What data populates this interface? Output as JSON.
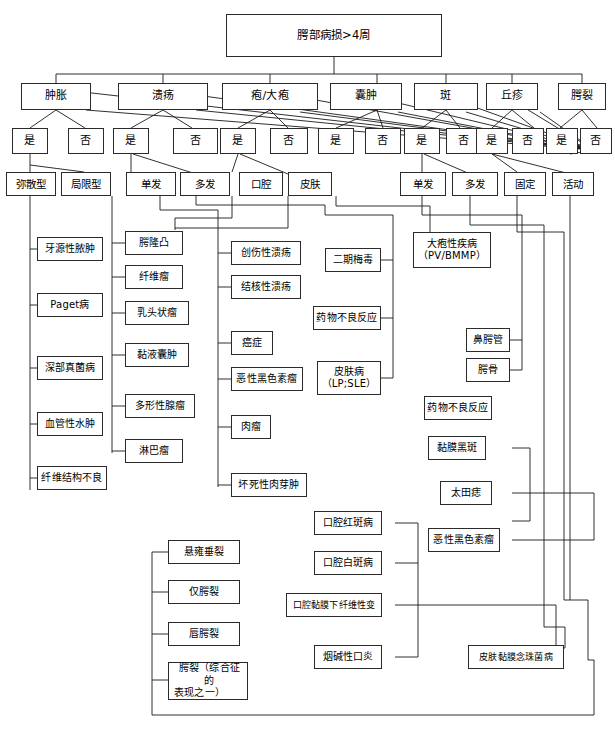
{
  "title": "腭部病损>4周",
  "root": {
    "label": "腭部病损>4周"
  },
  "categories": [
    {
      "id": "swelling",
      "label": "肿胀"
    },
    {
      "id": "ulcer",
      "label": "溃疡"
    },
    {
      "id": "vesicle",
      "label": "疱/大疱"
    },
    {
      "id": "cyst",
      "label": "囊肿"
    },
    {
      "id": "macule",
      "label": "斑"
    },
    {
      "id": "papule",
      "label": "丘疹"
    },
    {
      "id": "cleft",
      "label": "腭裂"
    }
  ],
  "decisions": [
    {
      "id": "swelling-yes",
      "label": "是"
    },
    {
      "id": "swelling-no",
      "label": "否"
    },
    {
      "id": "ulcer-yes",
      "label": "是"
    },
    {
      "id": "ulcer-no",
      "label": "否"
    },
    {
      "id": "vesicle-yes",
      "label": "是"
    },
    {
      "id": "vesicle-no",
      "label": "否"
    },
    {
      "id": "cyst-yes",
      "label": "是"
    },
    {
      "id": "cyst-no",
      "label": "否"
    },
    {
      "id": "macule-yes",
      "label": "是"
    },
    {
      "id": "macule-no",
      "label": "否"
    },
    {
      "id": "papule-yes",
      "label": "是"
    },
    {
      "id": "papule-no",
      "label": "否"
    },
    {
      "id": "cleft-yes",
      "label": "是"
    },
    {
      "id": "cleft-no",
      "label": "否"
    }
  ],
  "subtypes": [
    {
      "id": "diffuse",
      "label": "弥散型"
    },
    {
      "id": "localized",
      "label": "局限型"
    },
    {
      "id": "ulcer-single",
      "label": "单发"
    },
    {
      "id": "ulcer-multiple",
      "label": "多发"
    },
    {
      "id": "oral",
      "label": "口腔"
    },
    {
      "id": "skin",
      "label": "皮肤"
    },
    {
      "id": "cyst-single",
      "label": "单发"
    },
    {
      "id": "cyst-multiple",
      "label": "多发"
    },
    {
      "id": "fixed",
      "label": "固定"
    },
    {
      "id": "mobile",
      "label": "活动"
    }
  ],
  "diagnoses": {
    "diffuse_swelling": [
      {
        "id": "odontogenic-abscess",
        "label": "牙源性脓肿"
      },
      {
        "id": "paget-disease",
        "label": "Paget病"
      },
      {
        "id": "deep-fungal",
        "label": "深部真菌病"
      },
      {
        "id": "angioedema",
        "label": "血管性水肿"
      },
      {
        "id": "fibrous-dysplasia",
        "label": "纤维结构不良"
      }
    ],
    "localized_swelling": [
      {
        "id": "torus-palatinus",
        "label": "腭隆凸"
      },
      {
        "id": "fibroma",
        "label": "纤维瘤"
      },
      {
        "id": "papilloma",
        "label": "乳头状瘤"
      },
      {
        "id": "mucocele",
        "label": "黏液囊肿"
      },
      {
        "id": "pleomorphic-adenoma",
        "label": "多形性腺瘤"
      },
      {
        "id": "lymphoma",
        "label": "淋巴瘤"
      }
    ],
    "single_ulcer": [
      {
        "id": "traumatic-ulcer",
        "label": "创伤性溃疡"
      },
      {
        "id": "tuberculous-ulcer",
        "label": "结核性溃疡"
      },
      {
        "id": "carcinoma",
        "label": "癌症"
      },
      {
        "id": "malignant-melanoma-ulcer",
        "label": "恶性黑色素瘤"
      },
      {
        "id": "sarcoma",
        "label": "肉瘤"
      },
      {
        "id": "necrotizing-granuloma",
        "label": "坏死性肉芽肿"
      }
    ],
    "multiple_ulcer": [
      {
        "id": "secondary-syphilis",
        "label": "二期梅毒"
      },
      {
        "id": "drug-reaction-ulcer",
        "label": "药物不良反应"
      },
      {
        "id": "dermatosis",
        "label": "皮肤病\n（LP;SLE）",
        "line1": "皮肤病",
        "line2": "（LP;SLE）"
      }
    ],
    "vesicle_group": [
      {
        "id": "bullous-disease",
        "label": "大疱性疾病\n（PV/BMMP）",
        "line1": "大疱性疾病",
        "line2": "（PV/BMMP）"
      }
    ],
    "cyst_group": [
      {
        "id": "nasopalatine-duct",
        "label": "鼻腭管"
      },
      {
        "id": "palatine-bone",
        "label": "腭骨"
      }
    ],
    "macule_group": [
      {
        "id": "drug-reaction-macule",
        "label": "药物不良反应"
      },
      {
        "id": "mucosal-melanotic-macule",
        "label": "黏膜黑斑"
      },
      {
        "id": "nevus-of-ota",
        "label": "太田痣"
      },
      {
        "id": "malignant-melanoma-macule",
        "label": "恶性黑色素瘤"
      }
    ],
    "papule_group": [
      {
        "id": "oral-erythroplakia",
        "label": "口腔红斑病"
      },
      {
        "id": "oral-leukoplakia",
        "label": "口腔白斑病"
      },
      {
        "id": "osf",
        "label": "口腔黏膜下纤维性变"
      },
      {
        "id": "nicotinic-stomatitis",
        "label": "烟碱性口炎"
      },
      {
        "id": "mucocutaneous-candidiasis",
        "label": "皮肤黏膜念珠菌病"
      }
    ],
    "cleft_group": [
      {
        "id": "bifid-uvula",
        "label": "悬雍垂裂"
      },
      {
        "id": "cleft-palate-only",
        "label": "仅腭裂"
      },
      {
        "id": "cleft-lip-palate",
        "label": "唇腭裂"
      },
      {
        "id": "syndromic-cleft",
        "label": "腭裂（综合征的表现之一）",
        "line1": "腭裂（综合征的",
        "line2": "表现之一）"
      }
    ]
  },
  "colors": {
    "line": "#1a1a1a",
    "box_border": "#2b2b2b",
    "background": "#ffffff",
    "text": "#000000"
  }
}
